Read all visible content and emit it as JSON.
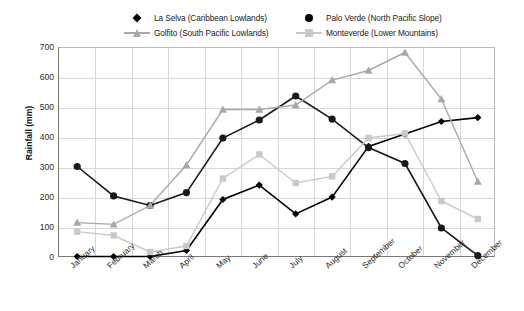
{
  "chart_data": {
    "type": "line",
    "title": "",
    "xlabel": "",
    "ylabel": "Rainfall (mm)",
    "ylim": [
      0,
      700
    ],
    "ytick_step": 100,
    "yticks": [
      0,
      100,
      200,
      300,
      400,
      500,
      600,
      700
    ],
    "grid": true,
    "legend_position": "top",
    "categories": [
      "January",
      "February",
      "March",
      "April",
      "May",
      "June",
      "July",
      "August",
      "September",
      "October",
      "November",
      "December"
    ],
    "series": [
      {
        "name": "La Selva (Caribbean Lowlands)",
        "color": "#000000",
        "marker": "diamond",
        "values": [
          5,
          5,
          5,
          25,
          195,
          243,
          147,
          203,
          372,
          413,
          455,
          468
        ]
      },
      {
        "name": "Palo Verde (North Pacific Slope)",
        "color": "#1a1a1a",
        "marker": "circle",
        "values": [
          305,
          207,
          175,
          218,
          400,
          460,
          540,
          463,
          368,
          315,
          100,
          8
        ]
      },
      {
        "name": "Golfito (South Pacific Lowlands)",
        "color": "#a8a8a8",
        "marker": "triangle",
        "values": [
          118,
          112,
          175,
          310,
          495,
          495,
          510,
          593,
          625,
          685,
          530,
          255
        ]
      },
      {
        "name": "Monteverde (Lower Mountains)",
        "color": "#c9c9c9",
        "marker": "square",
        "values": [
          88,
          75,
          20,
          40,
          265,
          345,
          250,
          272,
          400,
          415,
          190,
          130
        ]
      }
    ]
  }
}
